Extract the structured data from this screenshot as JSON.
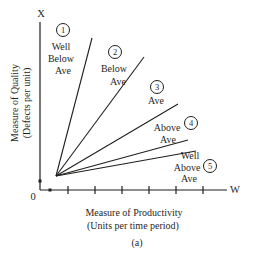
{
  "figure": {
    "caption": "(a)",
    "origin_label": "0",
    "y_axis": {
      "symbol": "X",
      "title_line1": "Measure of Quality",
      "title_line2": "(Defects per unit)"
    },
    "x_axis": {
      "symbol": "W",
      "title_line1": "Measure of Productivity",
      "title_line2": "(Units per time period)"
    }
  },
  "chart_data": {
    "type": "line",
    "title": "",
    "xlabel": "Measure of Productivity (Units per time period)",
    "ylabel": "Measure of Quality (Defects per unit)",
    "x_axis_end_label": "W",
    "y_axis_end_label": "X",
    "origin_label": "0",
    "caption": "(a)",
    "grid": false,
    "axes_qualitative": true,
    "line_color": "#1f1f1d",
    "x_tick_positions_px": [
      68,
      95,
      122,
      149,
      176,
      203
    ],
    "axis_marker_dots_px": [
      [
        40,
        181
      ],
      [
        50,
        190
      ]
    ],
    "origin_px": [
      56,
      176
    ],
    "axis_corner_px": [
      40,
      190
    ],
    "y_axis_top_px": 22,
    "x_axis_right_px": 227,
    "series": [
      {
        "number": "1",
        "label": "Well Below Ave",
        "slope": "steepest",
        "line_end_px": [
          92,
          38
        ],
        "circle_px": [
          63,
          30
        ],
        "label_lines": [
          {
            "text": "Well",
            "x": 61,
            "y": 50
          },
          {
            "text": "Below",
            "x": 61,
            "y": 62
          },
          {
            "text": "Ave",
            "x": 63,
            "y": 74
          }
        ]
      },
      {
        "number": "2",
        "label": "Below Ave",
        "slope": "steep",
        "line_end_px": [
          144,
          57
        ],
        "circle_px": [
          115,
          52
        ],
        "label_lines": [
          {
            "text": "Below",
            "x": 114,
            "y": 72
          },
          {
            "text": "Ave",
            "x": 118,
            "y": 85
          }
        ]
      },
      {
        "number": "3",
        "label": "Ave",
        "slope": "moderate",
        "line_end_px": [
          178,
          104
        ],
        "circle_px": [
          157,
          87
        ],
        "label_lines": [
          {
            "text": "Ave",
            "x": 156,
            "y": 104
          }
        ]
      },
      {
        "number": "4",
        "label": "Above Ave",
        "slope": "shallow",
        "line_end_px": [
          188,
          140
        ],
        "circle_px": [
          191,
          123
        ],
        "label_lines": [
          {
            "text": "Above",
            "x": 167,
            "y": 131
          },
          {
            "text": "Ave",
            "x": 168,
            "y": 143
          }
        ]
      },
      {
        "number": "5",
        "label": "Well Above Ave",
        "slope": "flattest",
        "line_end_px": [
          196,
          151
        ],
        "circle_px": [
          210,
          166
        ],
        "label_lines": [
          {
            "text": "Well",
            "x": 190,
            "y": 159
          },
          {
            "text": "Above",
            "x": 187,
            "y": 171
          },
          {
            "text": "Ave",
            "x": 189,
            "y": 182
          }
        ]
      }
    ]
  }
}
